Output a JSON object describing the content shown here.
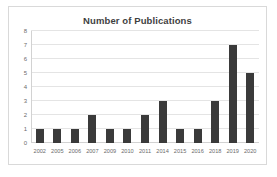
{
  "chart_data": {
    "type": "bar",
    "title": "Number of Publications",
    "xlabel": "",
    "ylabel": "",
    "categories": [
      "2002",
      "2005",
      "2006",
      "2007",
      "2009",
      "2010",
      "2011",
      "2014",
      "2015",
      "2016",
      "2018",
      "2019",
      "2020"
    ],
    "values": [
      1,
      1,
      1,
      2,
      1,
      1,
      2,
      3,
      1,
      1,
      3,
      7,
      5
    ],
    "ylim": [
      0,
      8
    ],
    "yticks": [
      0,
      1,
      2,
      3,
      4,
      5,
      6,
      7,
      8
    ],
    "ytick_labels": [
      "0",
      "1",
      "2",
      "3",
      "4",
      "5",
      "6",
      "7",
      "8"
    ],
    "grid": true,
    "legend": false,
    "bar_color": "#3a3a3a",
    "gridline_color": "#e4e4e4",
    "title_color": "#3f3f3f",
    "tick_label_color": "#6b6b6b",
    "plot_background": "#ffffff",
    "frame_border_color": "#d9d9d9"
  }
}
